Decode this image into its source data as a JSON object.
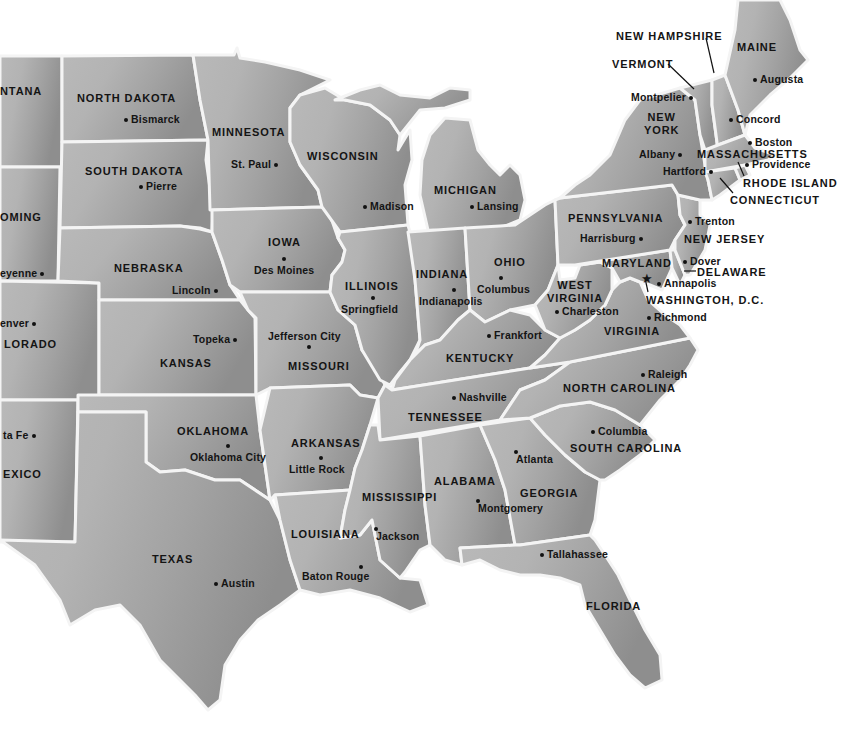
{
  "map": {
    "colors": {
      "water": "#ffffff",
      "land_light": "#b8b8b8",
      "land_mid": "#a6a6a6",
      "land_dark": "#8f8f8f",
      "border": "#f4f4f4",
      "text": "#141414"
    },
    "states": [
      {
        "id": "montana",
        "label": "NTANA",
        "x": 0,
        "y": 85
      },
      {
        "id": "north-dakota",
        "label": "NORTH DAKOTA",
        "x": 77,
        "y": 92
      },
      {
        "id": "south-dakota",
        "label": "SOUTH DAKOTA",
        "x": 85,
        "y": 165
      },
      {
        "id": "wyoming",
        "label": "OMING",
        "x": 0,
        "y": 211
      },
      {
        "id": "minnesota",
        "label": "MINNESOTA",
        "x": 212,
        "y": 126
      },
      {
        "id": "wisconsin",
        "label": "WISCONSIN",
        "x": 307,
        "y": 150
      },
      {
        "id": "michigan",
        "label": "MICHIGAN",
        "x": 434,
        "y": 184
      },
      {
        "id": "iowa",
        "label": "IOWA",
        "x": 268,
        "y": 236
      },
      {
        "id": "nebraska",
        "label": "NEBRASKA",
        "x": 114,
        "y": 262
      },
      {
        "id": "illinois",
        "label": "ILLINOIS",
        "x": 345,
        "y": 280
      },
      {
        "id": "indiana",
        "label": "INDIANA",
        "x": 416,
        "y": 268
      },
      {
        "id": "ohio",
        "label": "OHIO",
        "x": 494,
        "y": 256
      },
      {
        "id": "pennsylvania",
        "label": "PENNSYLVANIA",
        "x": 568,
        "y": 212
      },
      {
        "id": "new-york",
        "label": "NEW\nYORK",
        "x": 644,
        "y": 111
      },
      {
        "id": "maine",
        "label": "MAINE",
        "x": 737,
        "y": 41
      },
      {
        "id": "new-hampshire",
        "label": "NEW HAMPSHIRE",
        "x": 616,
        "y": 30
      },
      {
        "id": "vermont",
        "label": "VERMONT",
        "x": 612,
        "y": 58
      },
      {
        "id": "massachusetts",
        "label": "MASSACHUSETTS",
        "x": 697,
        "y": 148
      },
      {
        "id": "rhode-island",
        "label": "RHODE ISLAND",
        "x": 743,
        "y": 177
      },
      {
        "id": "connecticut",
        "label": "CONNECTICUT",
        "x": 730,
        "y": 194
      },
      {
        "id": "new-jersey",
        "label": "NEW JERSEY",
        "x": 684,
        "y": 233
      },
      {
        "id": "delaware",
        "label": "DELAWARE",
        "x": 697,
        "y": 266
      },
      {
        "id": "maryland",
        "label": "MARYLAND",
        "x": 602,
        "y": 257
      },
      {
        "id": "west-virginia",
        "label": "WEST\nVIRGINIA",
        "x": 547,
        "y": 279
      },
      {
        "id": "virginia",
        "label": "VIRGINIA",
        "x": 604,
        "y": 325
      },
      {
        "id": "colorado",
        "label": "LORADO",
        "x": 4,
        "y": 338
      },
      {
        "id": "kansas",
        "label": "KANSAS",
        "x": 160,
        "y": 357
      },
      {
        "id": "missouri",
        "label": "MISSOURI",
        "x": 288,
        "y": 360
      },
      {
        "id": "kentucky",
        "label": "KENTUCKY",
        "x": 446,
        "y": 352
      },
      {
        "id": "north-carolina",
        "label": "NORTH CAROLINA",
        "x": 563,
        "y": 382
      },
      {
        "id": "tennessee",
        "label": "TENNESSEE",
        "x": 408,
        "y": 411
      },
      {
        "id": "oklahoma",
        "label": "OKLAHOMA",
        "x": 177,
        "y": 425
      },
      {
        "id": "arkansas",
        "label": "ARKANSAS",
        "x": 291,
        "y": 437
      },
      {
        "id": "south-carolina",
        "label": "SOUTH CAROLINA",
        "x": 570,
        "y": 442
      },
      {
        "id": "new-mexico",
        "label": "EXICO",
        "x": 3,
        "y": 468
      },
      {
        "id": "alabama",
        "label": "ALABAMA",
        "x": 434,
        "y": 475
      },
      {
        "id": "georgia",
        "label": "GEORGIA",
        "x": 520,
        "y": 487
      },
      {
        "id": "mississippi",
        "label": "MISSISSIPPI",
        "x": 362,
        "y": 491
      },
      {
        "id": "louisiana",
        "label": "LOUISIANA",
        "x": 291,
        "y": 528
      },
      {
        "id": "texas",
        "label": "TEXAS",
        "x": 152,
        "y": 553
      },
      {
        "id": "florida",
        "label": "FLORIDA",
        "x": 586,
        "y": 600
      }
    ],
    "capitals": [
      {
        "name": "Bismarck",
        "x": 124,
        "y": 114,
        "dot": "left"
      },
      {
        "name": "Pierre",
        "x": 139,
        "y": 181,
        "dot": "left"
      },
      {
        "name": "St. Paul",
        "x": 231,
        "y": 159,
        "dot": "right"
      },
      {
        "name": "Madison",
        "x": 363,
        "y": 201,
        "dot": "left"
      },
      {
        "name": "Lansing",
        "x": 470,
        "y": 201,
        "dot": "left"
      },
      {
        "name": "Montpelier",
        "x": 631,
        "y": 92,
        "dot": "right"
      },
      {
        "name": "Augusta",
        "x": 753,
        "y": 74,
        "dot": "left"
      },
      {
        "name": "Concord",
        "x": 729,
        "y": 114,
        "dot": "left"
      },
      {
        "name": "Boston",
        "x": 748,
        "y": 137,
        "dot": "left"
      },
      {
        "name": "Albany",
        "x": 639,
        "y": 149,
        "dot": "right"
      },
      {
        "name": "Providence",
        "x": 745,
        "y": 159,
        "dot": "left"
      },
      {
        "name": "Hartford",
        "x": 663,
        "y": 166,
        "dot": "right"
      },
      {
        "name": "Trenton",
        "x": 688,
        "y": 216,
        "dot": "left"
      },
      {
        "name": "Harrisburg",
        "x": 580,
        "y": 233,
        "dot": "right"
      },
      {
        "name": "Dover",
        "x": 683,
        "y": 256,
        "dot": "left"
      },
      {
        "name": "Annapolis",
        "x": 657,
        "y": 278,
        "dot": "left"
      },
      {
        "name": "Richmond",
        "x": 647,
        "y": 312,
        "dot": "left"
      },
      {
        "name": "Charleston",
        "x": 555,
        "y": 306,
        "dot": "left"
      },
      {
        "name": "Raleigh",
        "x": 641,
        "y": 369,
        "dot": "left"
      },
      {
        "name": "Columbia",
        "x": 591,
        "y": 426,
        "dot": "left"
      },
      {
        "name": "Eyenne",
        "display": "eyenne",
        "x": 0,
        "y": 268,
        "dot": "below-right"
      },
      {
        "name": "Des Moines",
        "x": 254,
        "y": 265,
        "dot": "above"
      },
      {
        "name": "Lincoln",
        "x": 172,
        "y": 285,
        "dot": "right"
      },
      {
        "name": "Springfield",
        "x": 341,
        "y": 304,
        "dot": "above"
      },
      {
        "name": "Indianapolis",
        "x": 419,
        "y": 296,
        "dot": "above"
      },
      {
        "name": "Columbus",
        "x": 477,
        "y": 284,
        "dot": "above"
      },
      {
        "name": "Frankfort",
        "x": 487,
        "y": 330,
        "dot": "left"
      },
      {
        "name": "Jefferson City",
        "x": 268,
        "y": 331,
        "dot": "below"
      },
      {
        "name": "Topeka",
        "x": 193,
        "y": 334,
        "dot": "right"
      },
      {
        "name": "Nashville",
        "x": 452,
        "y": 392,
        "dot": "left"
      },
      {
        "name": "Oklahoma City",
        "x": 190,
        "y": 452,
        "dot": "above"
      },
      {
        "name": "Little Rock",
        "x": 289,
        "y": 464,
        "dot": "above"
      },
      {
        "name": "Atlanta",
        "x": 516,
        "y": 454,
        "dot": "above-left"
      },
      {
        "name": "Montgomery",
        "x": 478,
        "y": 503,
        "dot": "above-left"
      },
      {
        "name": "Jackson",
        "x": 376,
        "y": 531,
        "dot": "above-left"
      },
      {
        "name": "Baton Rouge",
        "x": 302,
        "y": 571,
        "dot": "above-right"
      },
      {
        "name": "Tallahassee",
        "x": 540,
        "y": 549,
        "dot": "left"
      },
      {
        "name": "Austin",
        "x": 214,
        "y": 578,
        "dot": "left"
      },
      {
        "name": "Denver",
        "display": "enver",
        "x": 0,
        "y": 318,
        "dot": "right"
      },
      {
        "name": "Santa Fe",
        "display": "ta Fe",
        "x": 3,
        "y": 430,
        "dot": "right"
      }
    ],
    "national_capital": {
      "name": "WASHINGTON, D.C.",
      "display": "WASHINGTOH, D.C.",
      "x": 646,
      "y": 295,
      "star_x": 641,
      "star_y": 272,
      "symbol": "★"
    }
  }
}
